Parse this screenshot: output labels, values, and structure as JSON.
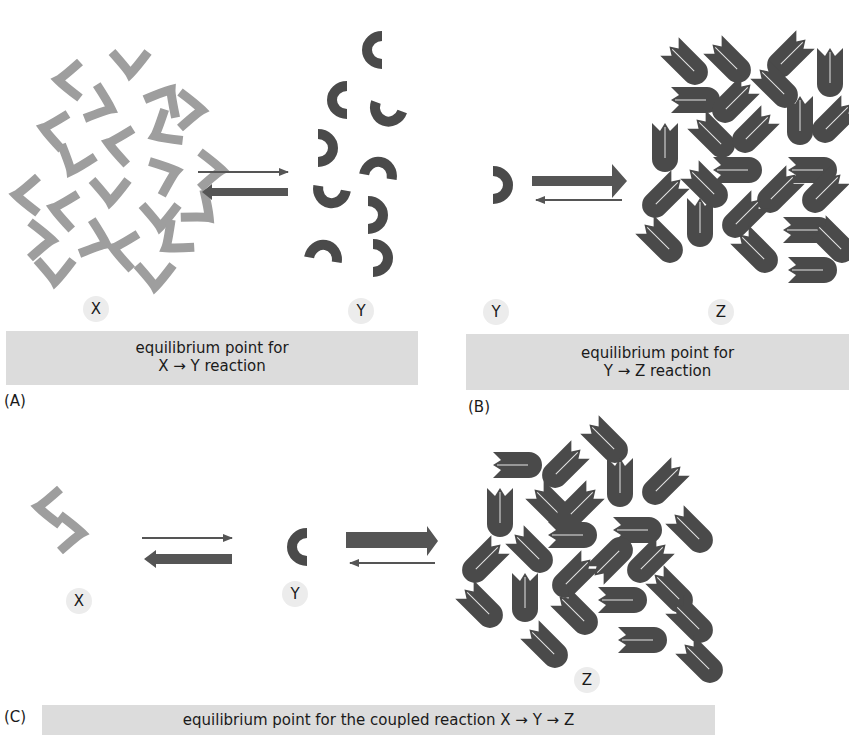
{
  "figure": {
    "panels": [
      {
        "id": "A",
        "tag": "(A)",
        "molecules": [
          {
            "label": "X",
            "count": 22,
            "color": "#9e9e9e",
            "shape": "chevron"
          },
          {
            "label": "Y",
            "count": 9,
            "color": "#4a4a4a",
            "shape": "horseshoe"
          }
        ],
        "arrows": {
          "forward": "thin",
          "reverse": "thick"
        },
        "caption_line1": "equilibrium point for",
        "caption_line2": "X → Y reaction"
      },
      {
        "id": "B",
        "tag": "(B)",
        "molecules": [
          {
            "label": "Y",
            "count": 1,
            "color": "#4a4a4a",
            "shape": "horseshoe"
          },
          {
            "label": "Z",
            "count": 30,
            "color": "#4a4a4a",
            "shape": "folded-rod"
          }
        ],
        "arrows": {
          "forward": "thick",
          "reverse": "thin"
        },
        "caption_line1": "equilibrium point for",
        "caption_line2": "Y → Z reaction"
      },
      {
        "id": "C",
        "tag": "(C)",
        "molecules": [
          {
            "label": "X",
            "count": 2,
            "color": "#9e9e9e",
            "shape": "chevron"
          },
          {
            "label": "Y",
            "count": 1,
            "color": "#4a4a4a",
            "shape": "horseshoe"
          },
          {
            "label": "Z",
            "count": 30,
            "color": "#4a4a4a",
            "shape": "folded-rod"
          }
        ],
        "arrows_xy": {
          "forward": "thin",
          "reverse": "thick"
        },
        "arrows_yz": {
          "forward": "thick",
          "reverse": "thin"
        },
        "caption_line1": "equilibrium point for the coupled reaction X → Y → Z"
      }
    ],
    "colors": {
      "x_molecule": "#9e9e9e",
      "y_z_molecule": "#4a4a4a",
      "arrow": "#555555",
      "caption_bg": "#dcdcdc",
      "label_bg": "#ececec"
    }
  }
}
